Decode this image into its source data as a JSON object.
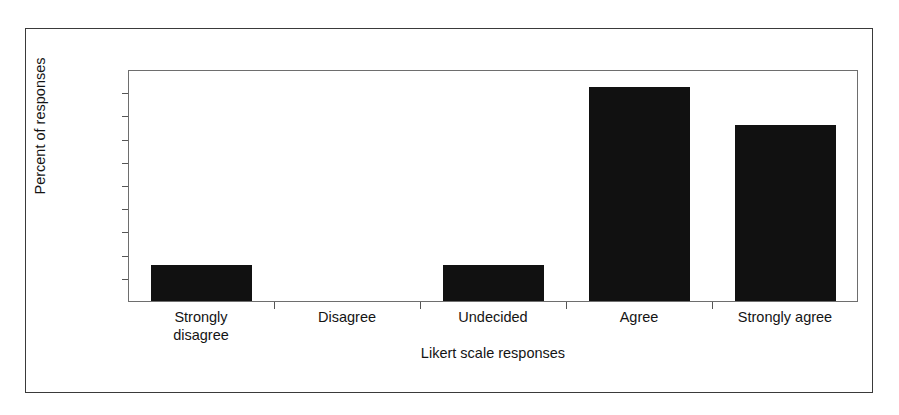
{
  "chart_data": {
    "type": "bar",
    "title": "",
    "xlabel": "Likert scale responses",
    "ylabel": "Percent of responses",
    "categories": [
      "Strongly disagree",
      "Disagree",
      "Undecided",
      "Agree",
      "Strongly agree"
    ],
    "category_lines": [
      [
        "Strongly",
        "disagree"
      ],
      [
        "Disagree"
      ],
      [
        "Undecided"
      ],
      [
        "Agree"
      ],
      [
        "Strongly agree"
      ]
    ],
    "values": [
      7.7,
      0.0,
      7.7,
      46.2,
      38.0
    ],
    "ylim": [
      0.0,
      50.0
    ],
    "ytick_step": 5.0,
    "ytick_labels": [
      "50.0",
      "45.0",
      "40.0",
      "35.0",
      "30.0",
      "25.0",
      "20.0",
      "15.0",
      "10.0",
      "5.0",
      "0.0"
    ],
    "ytick_values": [
      50.0,
      45.0,
      40.0,
      35.0,
      30.0,
      25.0,
      20.0,
      15.0,
      10.0,
      5.0,
      0.0
    ],
    "grid": false,
    "legend": false,
    "bar_color": "#111111",
    "axis_color": "#555555",
    "frame_color": "#3a3a3a",
    "background": "#ffffff"
  }
}
